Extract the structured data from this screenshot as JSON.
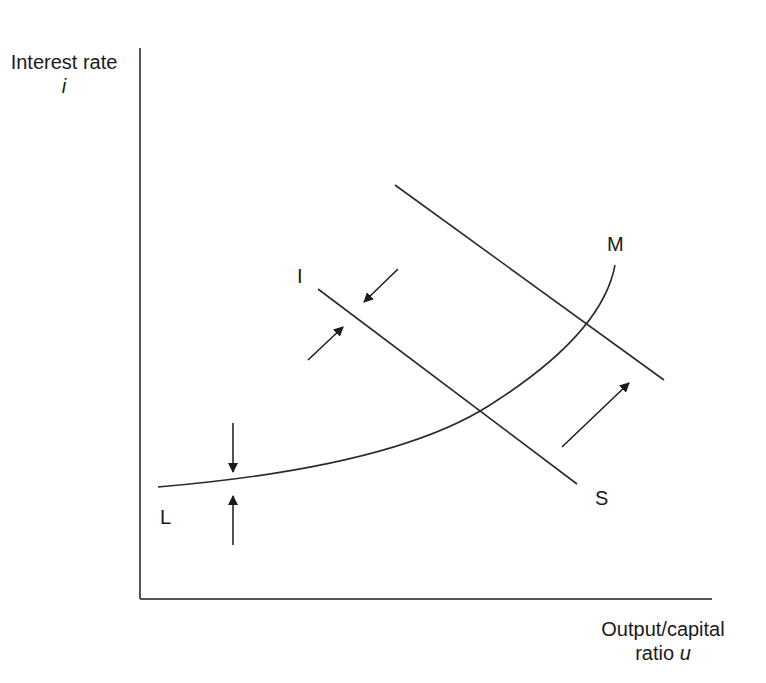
{
  "diagram": {
    "y_axis": {
      "label": "Interest rate",
      "symbol": "i"
    },
    "x_axis": {
      "label": "Output/capital",
      "label_line2": "ratio",
      "symbol": "u"
    },
    "curves": [
      {
        "id": "LM",
        "start_label": "L",
        "end_label": "M",
        "shape": "upward-convex"
      },
      {
        "id": "IS",
        "start_label": "I",
        "end_label": "S",
        "shape": "downward-line"
      },
      {
        "id": "IS-shifted",
        "shape": "downward-line",
        "note": "shifted outward/upward parallel to IS"
      }
    ],
    "arrows": [
      {
        "name": "lm-down-arrow",
        "direction": "down",
        "target": "LM"
      },
      {
        "name": "lm-up-arrow",
        "direction": "up",
        "target": "LM"
      },
      {
        "name": "is-inward-arrow",
        "direction": "down-left",
        "target": "IS"
      },
      {
        "name": "is-outward-arrow",
        "direction": "up-right",
        "target": "IS"
      },
      {
        "name": "is-shift-arrow",
        "direction": "up-right",
        "target": "IS-shifted"
      }
    ],
    "colors": {
      "line": "#2a2a2a",
      "axis": "#555555",
      "background": "#ffffff"
    }
  }
}
